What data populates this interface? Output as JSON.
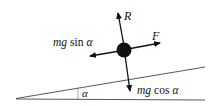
{
  "diagram": {
    "type": "free-body diagram on inclined plane",
    "labels": {
      "normal": "R",
      "friction": "F",
      "parallel_component": "mg sin α",
      "perpendicular_component": "mg cos α",
      "angle": "α"
    },
    "parts": {
      "mg": "mg",
      "sin": "sin",
      "cos": "cos",
      "alpha": "α"
    },
    "colors": {
      "ink": "#111111",
      "line": "#333333",
      "background": "#ffffff"
    }
  }
}
